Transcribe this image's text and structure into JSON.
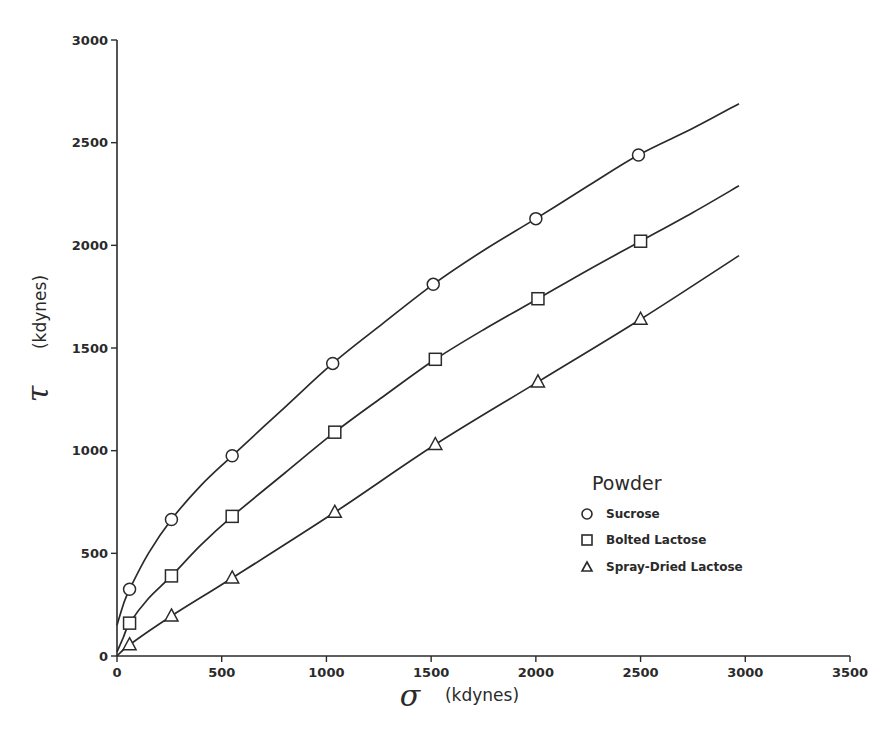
{
  "chart_data": {
    "type": "line",
    "title": "",
    "xlabel_symbol": "σ",
    "xlabel_unit": "(kdynes)",
    "ylabel_symbol": "τ",
    "ylabel_unit": "(kdynes)",
    "xlim": [
      0,
      3500
    ],
    "ylim": [
      0,
      3000
    ],
    "x_ticks": [
      0,
      500,
      1000,
      1500,
      2000,
      2500,
      3000,
      3500
    ],
    "y_ticks": [
      0,
      500,
      1000,
      1500,
      2000,
      2500,
      3000
    ],
    "grid": false,
    "legend_title": "Powder",
    "legend_position": "lower-right",
    "series": [
      {
        "name": "Sucrose",
        "marker": "circle",
        "points": [
          [
            60,
            325
          ],
          [
            260,
            665
          ],
          [
            550,
            975
          ],
          [
            1030,
            1425
          ],
          [
            1510,
            1810
          ],
          [
            2000,
            2130
          ],
          [
            2490,
            2440
          ]
        ],
        "curve": [
          [
            0,
            150
          ],
          [
            30,
            250
          ],
          [
            60,
            325
          ],
          [
            150,
            500
          ],
          [
            260,
            665
          ],
          [
            400,
            830
          ],
          [
            550,
            975
          ],
          [
            800,
            1210
          ],
          [
            1030,
            1425
          ],
          [
            1270,
            1620
          ],
          [
            1510,
            1810
          ],
          [
            1750,
            1975
          ],
          [
            2000,
            2130
          ],
          [
            2250,
            2290
          ],
          [
            2490,
            2440
          ],
          [
            2750,
            2570
          ],
          [
            2970,
            2690
          ]
        ]
      },
      {
        "name": "Bolted Lactose",
        "marker": "square",
        "points": [
          [
            60,
            160
          ],
          [
            260,
            390
          ],
          [
            550,
            680
          ],
          [
            1040,
            1090
          ],
          [
            1520,
            1445
          ],
          [
            2010,
            1740
          ],
          [
            2500,
            2020
          ]
        ],
        "curve": [
          [
            0,
            20
          ],
          [
            30,
            90
          ],
          [
            60,
            160
          ],
          [
            150,
            280
          ],
          [
            260,
            390
          ],
          [
            400,
            540
          ],
          [
            550,
            680
          ],
          [
            800,
            890
          ],
          [
            1040,
            1090
          ],
          [
            1280,
            1270
          ],
          [
            1520,
            1445
          ],
          [
            1760,
            1595
          ],
          [
            2010,
            1740
          ],
          [
            2250,
            1880
          ],
          [
            2500,
            2020
          ],
          [
            2750,
            2160
          ],
          [
            2970,
            2290
          ]
        ]
      },
      {
        "name": "Spray-Dried Lactose",
        "marker": "triangle",
        "points": [
          [
            60,
            55
          ],
          [
            260,
            195
          ],
          [
            550,
            380
          ],
          [
            1040,
            700
          ],
          [
            1520,
            1030
          ],
          [
            2010,
            1335
          ],
          [
            2500,
            1640
          ]
        ],
        "curve": [
          [
            0,
            0
          ],
          [
            60,
            55
          ],
          [
            260,
            195
          ],
          [
            550,
            380
          ],
          [
            1040,
            700
          ],
          [
            1520,
            1030
          ],
          [
            2010,
            1335
          ],
          [
            2500,
            1640
          ],
          [
            2970,
            1950
          ]
        ]
      }
    ]
  },
  "legend": {
    "title": "Powder",
    "items": [
      {
        "label": "Sucrose",
        "marker": "circle"
      },
      {
        "label": "Bolted Lactose",
        "marker": "square"
      },
      {
        "label": "Spray-Dried Lactose",
        "marker": "triangle"
      }
    ]
  },
  "axes": {
    "x_symbol": "σ",
    "x_unit": "(kdynes)",
    "y_symbol": "τ",
    "y_unit": "(kdynes)"
  },
  "colors": {
    "ink": "#2a2a2a",
    "background": "#ffffff"
  }
}
